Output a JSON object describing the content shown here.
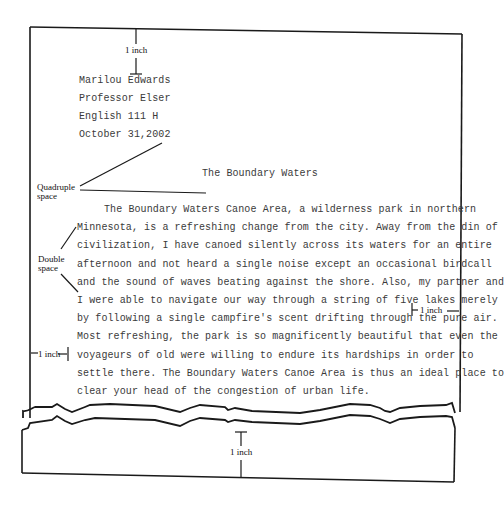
{
  "heading": {
    "lines": [
      "Marilou Edwards",
      "Professor Elser",
      "English 111 H",
      "October 31,2002"
    ]
  },
  "title": "The Boundary Waters",
  "body": {
    "lines": [
      "The Boundary Waters Canoe Area, a wilderness park in northern",
      "Minnesota, is a refreshing change from the city. Away from the din of",
      "civilization, I have canoed silently across its waters for an entire",
      "afternoon and not heard a single noise except an occasional birdcall",
      "and the sound of waves beating against the shore. Also, my partner and",
      "I were able to navigate our way through a string of five lakes merely",
      "by following a single campfire's scent drifting through the pure air.",
      "Most refreshing, the park is so magnificently beautiful that even the",
      "voyageurs of old were willing to endure its hardships in order to",
      "settle there. The Boundary Waters Canoe Area is thus an ideal place to",
      "clear your head of the congestion of urban life."
    ]
  },
  "annotations": {
    "top_margin": "1 inch",
    "quadruple_space_line1": "Quadruple",
    "quadruple_space_line2": "space",
    "double_space_line1": "Double",
    "double_space_line2": "space",
    "right_margin": "1 inch",
    "left_margin": "1 inch",
    "bottom_margin": "1 inch"
  }
}
